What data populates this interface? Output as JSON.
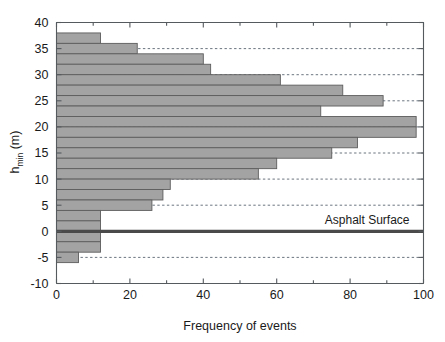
{
  "chart_data": {
    "type": "bar",
    "orientation": "horizontal",
    "title": "",
    "xlabel": "Frequency of events",
    "ylabel": "h_min (m)",
    "ylabel_parts": {
      "base": "h",
      "subscript": "min",
      "unit": " (m)"
    },
    "xlim": [
      0,
      100
    ],
    "ylim": [
      -10,
      40
    ],
    "xticks": [
      0,
      20,
      40,
      60,
      80,
      100
    ],
    "xtick_labels": [
      "0",
      "20",
      "40",
      "60",
      "80",
      "100"
    ],
    "yticks": [
      -10,
      -5,
      0,
      5,
      10,
      15,
      20,
      25,
      30,
      35,
      40
    ],
    "ytick_labels": [
      "-10",
      "-5",
      "0",
      "5",
      "10",
      "15",
      "20",
      "25",
      "30",
      "35",
      "40"
    ],
    "x_minor_tick_step": 10,
    "grid": "horizontal-dashed",
    "gridlines": [
      -5,
      0,
      5,
      10,
      15,
      20,
      25,
      30,
      35
    ],
    "legend": "none",
    "bin_width": 2,
    "categories": [
      37,
      35,
      33,
      31,
      29,
      27,
      25,
      23,
      21,
      19,
      17,
      15,
      13,
      11,
      9,
      7,
      5,
      3,
      1,
      -1,
      -3,
      -5
    ],
    "values": [
      12,
      22,
      40,
      42,
      61,
      78,
      89,
      72,
      98,
      98,
      82,
      75,
      60,
      55,
      31,
      29,
      26,
      12,
      12,
      12,
      12,
      6
    ],
    "bars": [
      {
        "bin_low": 36,
        "bin_high": 38,
        "center": 37,
        "value": 12
      },
      {
        "bin_low": 34,
        "bin_high": 36,
        "center": 35,
        "value": 22
      },
      {
        "bin_low": 32,
        "bin_high": 34,
        "center": 33,
        "value": 40
      },
      {
        "bin_low": 30,
        "bin_high": 32,
        "center": 31,
        "value": 42
      },
      {
        "bin_low": 28,
        "bin_high": 30,
        "center": 29,
        "value": 61
      },
      {
        "bin_low": 26,
        "bin_high": 28,
        "center": 27,
        "value": 78
      },
      {
        "bin_low": 24,
        "bin_high": 26,
        "center": 25,
        "value": 89
      },
      {
        "bin_low": 22,
        "bin_high": 24,
        "center": 23,
        "value": 72
      },
      {
        "bin_low": 20,
        "bin_high": 22,
        "center": 21,
        "value": 98
      },
      {
        "bin_low": 18,
        "bin_high": 20,
        "center": 19,
        "value": 98
      },
      {
        "bin_low": 16,
        "bin_high": 18,
        "center": 17,
        "value": 82
      },
      {
        "bin_low": 14,
        "bin_high": 16,
        "center": 15,
        "value": 75
      },
      {
        "bin_low": 12,
        "bin_high": 14,
        "center": 13,
        "value": 60
      },
      {
        "bin_low": 10,
        "bin_high": 12,
        "center": 11,
        "value": 55
      },
      {
        "bin_low": 8,
        "bin_high": 10,
        "center": 9,
        "value": 31
      },
      {
        "bin_low": 6,
        "bin_high": 8,
        "center": 7,
        "value": 29
      },
      {
        "bin_low": 4,
        "bin_high": 6,
        "center": 5,
        "value": 26
      },
      {
        "bin_low": 2,
        "bin_high": 4,
        "center": 3,
        "value": 12
      },
      {
        "bin_low": 0,
        "bin_high": 2,
        "center": 1,
        "value": 12
      },
      {
        "bin_low": -2,
        "bin_high": 0,
        "center": -1,
        "value": 12
      },
      {
        "bin_low": -4,
        "bin_high": -2,
        "center": -3,
        "value": 12
      },
      {
        "bin_low": -6,
        "bin_high": -4,
        "center": -5,
        "value": 6
      }
    ],
    "annotations": [
      {
        "name": "asphalt-surface",
        "label": "Asphalt Surface",
        "y": 0,
        "line": true,
        "color": "#4a4a4a"
      }
    ],
    "colors": {
      "bar_fill": "#a3a3a3",
      "bar_edge": "#5d5d5d",
      "axis": "#555a5e",
      "grid": "#5a6470",
      "surface_line": "#4a4a4a",
      "background": "#ffffff",
      "text": "#1a1a1a"
    }
  }
}
